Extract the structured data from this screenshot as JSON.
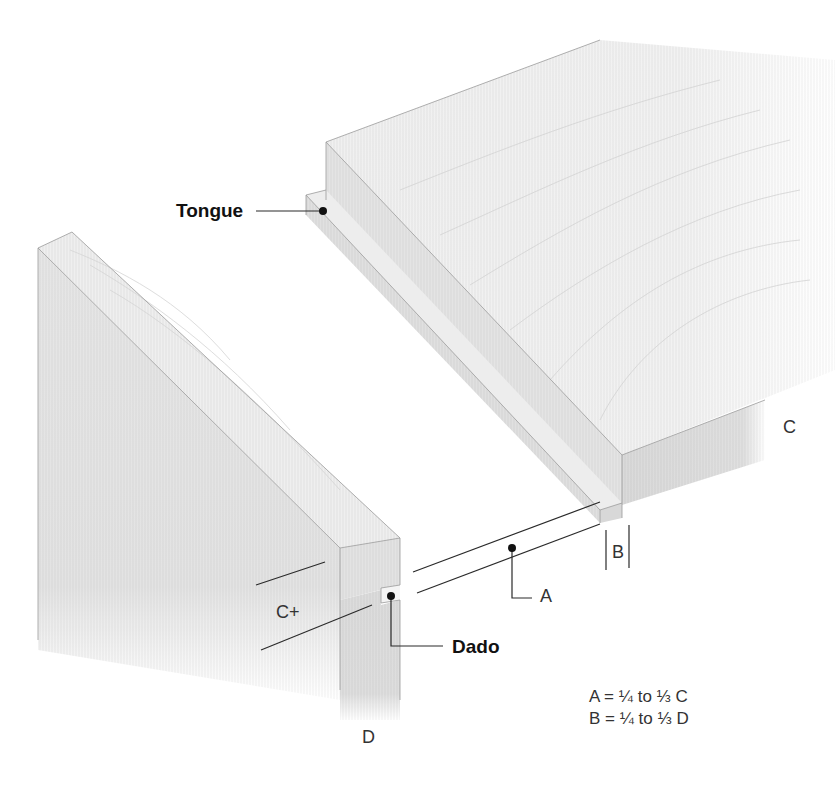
{
  "diagram": {
    "labels": {
      "tongue": "Tongue",
      "dado": "Dado",
      "a": "A",
      "b": "B",
      "c": "C",
      "c_plus": "C+",
      "d": "D"
    },
    "formulas": [
      "A = ¼ to ⅓ C",
      "B = ¼ to ⅓ D"
    ],
    "colors": {
      "background": "#ffffff",
      "wood_top": "#f0f0f0",
      "wood_side": "#e2e2e2",
      "wood_end": "#d9d9d9",
      "grain": "#cfcfcf",
      "edge": "#9a9a9a",
      "leader": "#222222"
    },
    "parts": [
      {
        "name": "tongue-board",
        "description": "Horizontal board with tongue along its edge; thickness labeled C"
      },
      {
        "name": "dado-board",
        "description": "Vertical board with dado groove near top; thickness labeled D"
      }
    ]
  }
}
